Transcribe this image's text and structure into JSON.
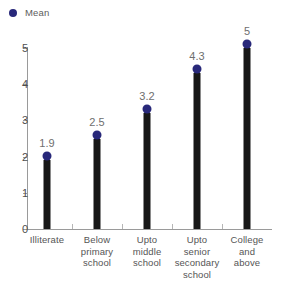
{
  "legend": {
    "marker_icon": "filled-circle-icon",
    "label": "Mean",
    "color": "#28287a"
  },
  "chart_data": {
    "type": "bar",
    "title": "",
    "subtitle": "",
    "xlabel": "",
    "ylabel": "",
    "categories": [
      "Illiterate",
      "Below primary school",
      "Upto middle school",
      "Upto senior secondary school",
      "College and above"
    ],
    "category_lines": [
      [
        "Illiterate"
      ],
      [
        "Below",
        "primary",
        "school"
      ],
      [
        "Upto",
        "middle",
        "school"
      ],
      [
        "Upto",
        "senior",
        "secondary",
        "school"
      ],
      [
        "College",
        "and",
        "above"
      ]
    ],
    "values": [
      1.9,
      2.5,
      3.2,
      4.3,
      5
    ],
    "value_labels": [
      "1.9",
      "2.5",
      "3.2",
      "4.3",
      "5"
    ],
    "series": [
      {
        "name": "Mean",
        "values": [
          1.9,
          2.5,
          3.2,
          4.3,
          5
        ]
      }
    ],
    "ylim": [
      0,
      5
    ],
    "ytick_labels": [
      "0",
      "1",
      "2",
      "3",
      "4",
      "5"
    ],
    "ytick_values": [
      0,
      1,
      2,
      3,
      4,
      5
    ],
    "grid": false,
    "legend_position": "top-left",
    "bar_color": "#171717",
    "marker_color": "#28287a",
    "axis_color": "#9a9a9a",
    "label_color": "#6e6e6e",
    "background": "#ffffff"
  }
}
